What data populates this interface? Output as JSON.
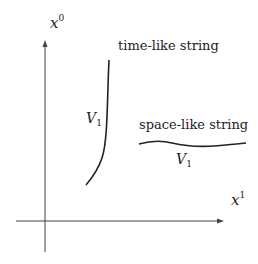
{
  "diagram": {
    "axes": {
      "vertical": {
        "var": "x",
        "index": "0"
      },
      "horizontal": {
        "var": "x",
        "index": "1"
      }
    },
    "curves": [
      {
        "id": "time-like",
        "label": "time-like string",
        "volume_label": {
          "var": "V",
          "index": "1"
        }
      },
      {
        "id": "space-like",
        "label": "space-like string",
        "volume_label": {
          "var": "V",
          "index": "1"
        }
      }
    ],
    "colors": {
      "stroke": "#222222",
      "axis": "#444444",
      "background": "#ffffff"
    }
  }
}
